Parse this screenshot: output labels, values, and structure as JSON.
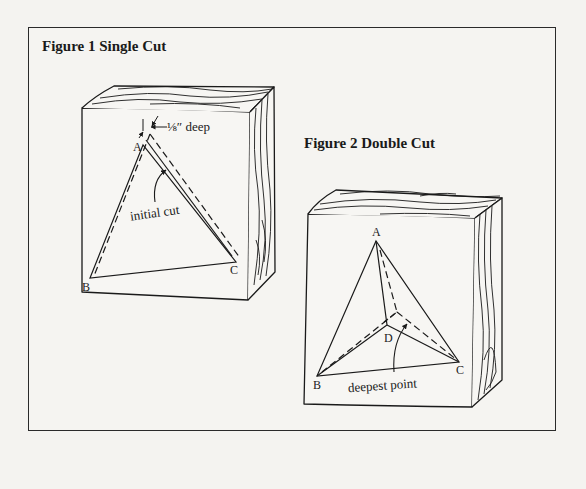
{
  "figures": [
    {
      "title": "Figure 1 Single Cut",
      "labels": {
        "vertex_a": "A",
        "vertex_b": "B",
        "vertex_c": "C",
        "depth_note": "⅛″ deep",
        "cut_note": "initial cut"
      }
    },
    {
      "title": "Figure 2 Double Cut",
      "labels": {
        "vertex_a": "A",
        "vertex_b": "B",
        "vertex_c": "C",
        "vertex_d": "D",
        "point_note": "deepest point"
      }
    }
  ],
  "colors": {
    "line": "#1a1a1a",
    "background": "#f4f3f0"
  }
}
